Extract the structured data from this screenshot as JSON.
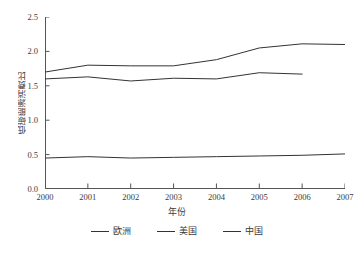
{
  "chart_data": {
    "type": "line",
    "title": "",
    "xlabel": "年份",
    "ylabel": "低碳能源消费比",
    "x": [
      2000,
      2001,
      2002,
      2003,
      2004,
      2005,
      2006,
      2007
    ],
    "xlim": [
      2000,
      2007
    ],
    "ylim": [
      0.0,
      2.5
    ],
    "yticks": [
      "0.0",
      "0.5",
      "1.0",
      "1.5",
      "2.0",
      "2.5"
    ],
    "ytick_values": [
      0.0,
      0.5,
      1.0,
      1.5,
      2.0,
      2.5
    ],
    "xticks": [
      "2000",
      "2001",
      "2002",
      "2003",
      "2004",
      "2005",
      "2006",
      "2007"
    ],
    "grid": false,
    "legend_position": "below",
    "series": [
      {
        "name": "欧洲",
        "color": "#333333",
        "x": [
          2000,
          2001,
          2002,
          2003,
          2004,
          2005,
          2006,
          2007
        ],
        "values": [
          1.7,
          1.8,
          1.79,
          1.79,
          1.88,
          2.05,
          2.11,
          2.1
        ]
      },
      {
        "name": "美国",
        "color": "#333333",
        "x": [
          2000,
          2001,
          2002,
          2003,
          2004,
          2005,
          2006
        ],
        "values": [
          1.6,
          1.63,
          1.57,
          1.61,
          1.6,
          1.69,
          1.67
        ]
      },
      {
        "name": "中国",
        "color": "#333333",
        "x": [
          2000,
          2001,
          2002,
          2003,
          2004,
          2005,
          2006,
          2007
        ],
        "values": [
          0.45,
          0.47,
          0.45,
          0.46,
          0.47,
          0.48,
          0.49,
          0.51
        ]
      }
    ]
  },
  "legend": {
    "items": [
      {
        "label": "欧洲"
      },
      {
        "label": "美国"
      },
      {
        "label": "中国"
      }
    ]
  },
  "axes": {
    "x_title": "年份",
    "y_title": "低碳能源消费比"
  }
}
